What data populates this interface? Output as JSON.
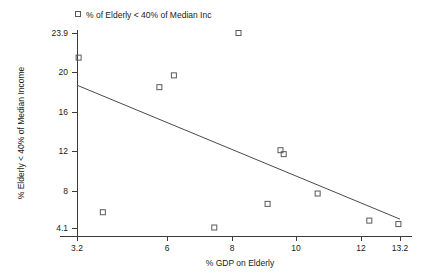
{
  "chart_data": {
    "type": "scatter",
    "title": "",
    "xlabel": "% GDP on Elderly",
    "ylabel": "% Elderly < 40% of Median Income",
    "xlim": [
      3.2,
      13.2
    ],
    "ylim": [
      4.1,
      23.9
    ],
    "xticks": [
      "3.2",
      "6",
      "8",
      "10",
      "12",
      "13.2"
    ],
    "xtick_values": [
      3.2,
      6,
      8,
      10,
      12,
      13.2
    ],
    "yticks": [
      "23.9",
      "20",
      "16",
      "12",
      "8",
      "4.1"
    ],
    "ytick_values": [
      23.9,
      20,
      16,
      12,
      8,
      4.1
    ],
    "grid": false,
    "legend_position": "top-left",
    "legend": [
      {
        "label": "% of Elderly < 40% of Median Inc",
        "marker": "open-square",
        "color": "#5a5a5a"
      }
    ],
    "series": [
      {
        "name": "% of Elderly < 40% of Median Inc",
        "marker": "open-square",
        "points": [
          {
            "x": 3.25,
            "y": 21.4
          },
          {
            "x": 4.0,
            "y": 5.7
          },
          {
            "x": 5.75,
            "y": 18.4
          },
          {
            "x": 6.2,
            "y": 19.6
          },
          {
            "x": 7.45,
            "y": 4.15
          },
          {
            "x": 8.2,
            "y": 23.9
          },
          {
            "x": 9.1,
            "y": 6.55
          },
          {
            "x": 9.5,
            "y": 12.0
          },
          {
            "x": 9.6,
            "y": 11.6
          },
          {
            "x": 10.65,
            "y": 7.6
          },
          {
            "x": 12.25,
            "y": 4.85
          },
          {
            "x": 13.15,
            "y": 4.5
          }
        ]
      }
    ],
    "trendline": {
      "type": "line",
      "x": [
        3.2,
        13.2
      ],
      "y": [
        18.6,
        5.0
      ],
      "color": "#4a4a4a"
    },
    "colors": {
      "marker_stroke": "#5a5a5a",
      "axis": "#3b3b3b",
      "trend": "#4a4a4a",
      "text": "#1a1a1a",
      "background": "#ffffff"
    }
  }
}
